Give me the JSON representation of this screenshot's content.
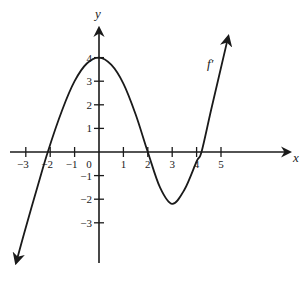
{
  "chart_data": {
    "type": "line",
    "title": "",
    "xlabel": "x",
    "ylabel": "y",
    "xlim": [
      -3.7,
      7.7
    ],
    "ylim": [
      -4.6,
      5.5
    ],
    "grid": false,
    "legend": null,
    "x_ticks": [
      -3,
      -2,
      -1,
      0,
      1,
      2,
      3,
      4,
      5
    ],
    "x_tick_labels": [
      "−3",
      "−2",
      "−1",
      "0",
      "1",
      "2",
      "3",
      "4",
      "5"
    ],
    "y_ticks": [
      -3,
      -2,
      -1,
      1,
      2,
      3,
      4
    ],
    "y_tick_labels": [
      "−3",
      "−2",
      "−1",
      "1",
      "2",
      "3",
      "4"
    ],
    "annotations": [
      {
        "text": "f′",
        "x": 4.5,
        "y": 3.8
      }
    ],
    "series": [
      {
        "name": "f′",
        "x": [
          -3.4,
          -3.0,
          -2.5,
          -2.1,
          -1.5,
          -1.0,
          -0.5,
          0,
          0.5,
          1.0,
          1.5,
          2.0,
          2.5,
          3.0,
          3.5,
          4.0,
          4.2,
          4.6,
          5.3
        ],
        "y": [
          -4.7,
          -3.2,
          -1.4,
          0,
          1.8,
          3.0,
          3.75,
          4.0,
          3.7,
          2.9,
          1.6,
          0,
          -1.5,
          -2.2,
          -1.6,
          -0.4,
          0,
          1.8,
          4.9
        ]
      }
    ],
    "key_points": {
      "maximum": [
        0,
        4
      ],
      "minimum": [
        3,
        -2.2
      ],
      "roots": [
        -2.1,
        2,
        4.2
      ]
    }
  },
  "labels": {
    "x_axis": "x",
    "y_axis": "y",
    "curve": "f′",
    "origin": "0"
  },
  "colors": {
    "ink": "#1a1a1a",
    "background": "#ffffff"
  }
}
